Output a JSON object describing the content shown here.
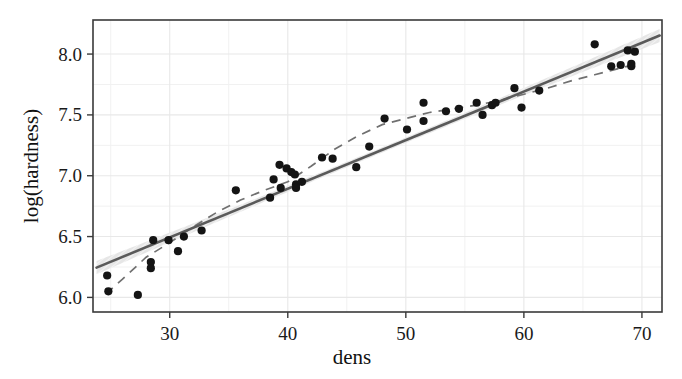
{
  "figure": {
    "background": "#ffffff",
    "width": 682,
    "height": 379
  },
  "chart_data": {
    "type": "scatter",
    "title": "",
    "subtitle": "",
    "xlabel": "dens",
    "ylabel": "log(hardness)",
    "xlim": [
      23.5,
      71.7
    ],
    "ylim": [
      5.88,
      8.28
    ],
    "xticks": [
      30,
      40,
      50,
      60,
      70
    ],
    "xtick_labels": [
      "30",
      "40",
      "50",
      "60",
      "70"
    ],
    "yticks": [
      6.0,
      6.5,
      7.0,
      7.5,
      8.0
    ],
    "ytick_labels": [
      "6.0",
      "6.5",
      "7.0",
      "7.5",
      "8.0"
    ],
    "x_minor_ticks": [
      25,
      35,
      45,
      55,
      65
    ],
    "y_minor_ticks": [
      6.25,
      6.75,
      7.25,
      7.75
    ],
    "grid": true,
    "grid_color": "#e8e8e8",
    "legend": null,
    "legend_position": "none",
    "point_color": "#141414",
    "point_size": 7,
    "x": [
      24.7,
      24.8,
      27.3,
      28.4,
      28.4,
      28.6,
      29.9,
      30.7,
      32.7,
      35.6,
      38.5,
      38.8,
      39.3,
      39.4,
      39.9,
      40.3,
      40.6,
      40.7,
      40.7,
      42.9,
      45.8,
      46.9,
      48.2,
      51.5,
      51.5,
      53.4,
      56.0,
      56.5,
      57.3,
      57.6,
      59.2,
      59.8,
      66.0,
      67.4,
      68.8,
      69.1,
      69.1,
      31.2,
      41.2,
      43.8,
      50.1,
      54.5,
      61.3,
      68.2,
      69.4
    ],
    "y": [
      6.18,
      6.05,
      6.02,
      6.29,
      6.24,
      6.47,
      6.47,
      6.38,
      6.55,
      6.88,
      6.82,
      6.97,
      7.09,
      6.9,
      7.06,
      7.03,
      7.01,
      6.93,
      6.9,
      7.15,
      7.07,
      7.24,
      7.47,
      7.6,
      7.45,
      7.53,
      7.6,
      7.5,
      7.58,
      7.6,
      7.72,
      7.56,
      8.08,
      7.9,
      8.03,
      7.92,
      7.9,
      6.5,
      6.95,
      7.14,
      7.38,
      7.55,
      7.7,
      7.91,
      8.02
    ],
    "fit_line": {
      "type": "linear_regression",
      "label": "OLS fit",
      "color": "#5a5a5a",
      "style": "solid",
      "x_start": 23.8,
      "x_end": 71.5,
      "y_start": 6.245,
      "y_end": 8.152
    },
    "confidence_band": {
      "label": "confidence band",
      "color": "#dcdcdc",
      "half_width_center": 0.022,
      "half_width_edge": 0.055
    },
    "smooth_curve": {
      "type": "loess",
      "label": "smoothed curve",
      "color": "#707070",
      "style": "dashed",
      "x": [
        24.6,
        26.0,
        28.0,
        30.0,
        32.0,
        34.0,
        36.0,
        38.0,
        40.0,
        42.0,
        44.0,
        46.0,
        48.0,
        50.0,
        52.0,
        54.0,
        56.0,
        58.0,
        60.0,
        62.0,
        64.0,
        66.0,
        68.0,
        69.6
      ],
      "y": [
        6.03,
        6.15,
        6.33,
        6.45,
        6.58,
        6.7,
        6.8,
        6.88,
        6.95,
        7.08,
        7.22,
        7.33,
        7.42,
        7.47,
        7.52,
        7.55,
        7.58,
        7.62,
        7.67,
        7.72,
        7.78,
        7.83,
        7.88,
        7.92
      ]
    }
  },
  "axes": {
    "frame_color": "#3a3a3a",
    "tick_color": "#3a3a3a"
  }
}
